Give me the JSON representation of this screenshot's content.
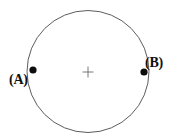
{
  "figure": {
    "background_color": "#ffffff",
    "width": 179,
    "height": 139,
    "circle": {
      "name": "circle-outline",
      "center_x": 88,
      "center_y": 71.5,
      "radius": 61,
      "stroke_color": "#4a4a4a",
      "stroke_width": 0.9,
      "fill": "none"
    },
    "center_marker": {
      "name": "center-cross",
      "glyph": "plus-icon",
      "x": 88,
      "y": 72,
      "size": 11,
      "stroke_color": "#6b6b6b",
      "stroke_width": 0.9
    },
    "points": [
      {
        "id": "A",
        "label": "(A)",
        "dot_x": 33,
        "dot_y": 70,
        "dot_radius": 3.6,
        "dot_color": "#0d0d0d",
        "label_side": "left"
      },
      {
        "id": "B",
        "label": "(B)",
        "dot_x": 144,
        "dot_y": 72,
        "dot_radius": 3.6,
        "dot_color": "#0d0d0d",
        "label_side": "right"
      }
    ]
  }
}
